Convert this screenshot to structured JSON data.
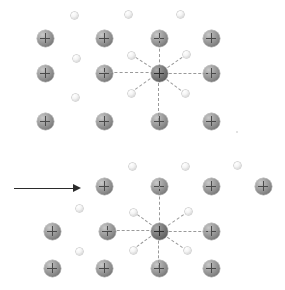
{
  "figure": {
    "title": "Crystal lattice of positive ions with free electrons",
    "caption_top": "Lattice at rest",
    "caption_bottom": "Lattice under applied field",
    "background_color": "#ffffff",
    "ion_color": "#8e8e8e",
    "center_ion_color": "#6f6f6f",
    "electron_color": "#f4f4f4",
    "bond_color": "#9a9a9a",
    "arrow_color": "#2b2b2b",
    "ion_symbol": "+",
    "ion_label": "positive-ion",
    "electron_label": "free-electron",
    "arrow_label": "applied-field-direction",
    "arrow_direction": "right"
  },
  "panels": [
    {
      "id": "top",
      "name": "lattice-at-rest",
      "ions": [
        {
          "x": 45,
          "y": 38,
          "center": false
        },
        {
          "x": 104,
          "y": 38,
          "center": false
        },
        {
          "x": 159,
          "y": 38,
          "center": false
        },
        {
          "x": 211,
          "y": 38,
          "center": false
        },
        {
          "x": 45,
          "y": 73,
          "center": false
        },
        {
          "x": 104,
          "y": 73,
          "center": false
        },
        {
          "x": 159,
          "y": 73,
          "center": true
        },
        {
          "x": 211,
          "y": 73,
          "center": false
        },
        {
          "x": 45,
          "y": 121,
          "center": false
        },
        {
          "x": 104,
          "y": 121,
          "center": false
        },
        {
          "x": 159,
          "y": 121,
          "center": false
        },
        {
          "x": 211,
          "y": 121,
          "center": false
        }
      ],
      "electrons": [
        {
          "x": 74,
          "y": 15
        },
        {
          "x": 128,
          "y": 14
        },
        {
          "x": 180,
          "y": 14
        },
        {
          "x": 76,
          "y": 58
        },
        {
          "x": 131,
          "y": 55
        },
        {
          "x": 186,
          "y": 54
        },
        {
          "x": 75,
          "y": 97
        },
        {
          "x": 131,
          "y": 93
        },
        {
          "x": 185,
          "y": 93
        }
      ],
      "bonds": [
        {
          "x1": 159,
          "y1": 73,
          "x2": 104,
          "y2": 73
        },
        {
          "x1": 159,
          "y1": 73,
          "x2": 211,
          "y2": 73
        },
        {
          "x1": 159,
          "y1": 73,
          "x2": 159,
          "y2": 38
        },
        {
          "x1": 159,
          "y1": 73,
          "x2": 159,
          "y2": 121
        },
        {
          "x1": 159,
          "y1": 73,
          "x2": 131,
          "y2": 55
        },
        {
          "x1": 159,
          "y1": 73,
          "x2": 186,
          "y2": 54
        },
        {
          "x1": 159,
          "y1": 73,
          "x2": 131,
          "y2": 93
        },
        {
          "x1": 159,
          "y1": 73,
          "x2": 185,
          "y2": 93
        }
      ],
      "specks": [
        {
          "x": 236,
          "y": 131
        }
      ],
      "arrow": null
    },
    {
      "id": "bottom",
      "name": "lattice-displaced",
      "ions": [
        {
          "x": 104,
          "y": 186,
          "center": false
        },
        {
          "x": 159,
          "y": 186,
          "center": false
        },
        {
          "x": 211,
          "y": 186,
          "center": false
        },
        {
          "x": 263,
          "y": 186,
          "center": false
        },
        {
          "x": 52,
          "y": 231,
          "center": false
        },
        {
          "x": 107,
          "y": 231,
          "center": false
        },
        {
          "x": 159,
          "y": 231,
          "center": true
        },
        {
          "x": 211,
          "y": 231,
          "center": false
        },
        {
          "x": 52,
          "y": 268,
          "center": false
        },
        {
          "x": 104,
          "y": 268,
          "center": false
        },
        {
          "x": 159,
          "y": 268,
          "center": false
        },
        {
          "x": 211,
          "y": 268,
          "center": false
        }
      ],
      "electrons": [
        {
          "x": 132,
          "y": 166
        },
        {
          "x": 185,
          "y": 166
        },
        {
          "x": 237,
          "y": 165
        },
        {
          "x": 79,
          "y": 208
        },
        {
          "x": 133,
          "y": 212
        },
        {
          "x": 188,
          "y": 211
        },
        {
          "x": 79,
          "y": 251
        },
        {
          "x": 133,
          "y": 250
        },
        {
          "x": 187,
          "y": 250
        }
      ],
      "bonds": [
        {
          "x1": 159,
          "y1": 231,
          "x2": 107,
          "y2": 231
        },
        {
          "x1": 159,
          "y1": 231,
          "x2": 211,
          "y2": 231
        },
        {
          "x1": 159,
          "y1": 231,
          "x2": 159,
          "y2": 186
        },
        {
          "x1": 159,
          "y1": 231,
          "x2": 159,
          "y2": 268
        },
        {
          "x1": 159,
          "y1": 231,
          "x2": 133,
          "y2": 212
        },
        {
          "x1": 159,
          "y1": 231,
          "x2": 188,
          "y2": 211
        },
        {
          "x1": 159,
          "y1": 231,
          "x2": 133,
          "y2": 250
        },
        {
          "x1": 159,
          "y1": 231,
          "x2": 187,
          "y2": 250
        }
      ],
      "specks": [],
      "arrow": {
        "x1": 14,
        "y1": 188,
        "x2": 80,
        "y2": 188
      }
    }
  ]
}
